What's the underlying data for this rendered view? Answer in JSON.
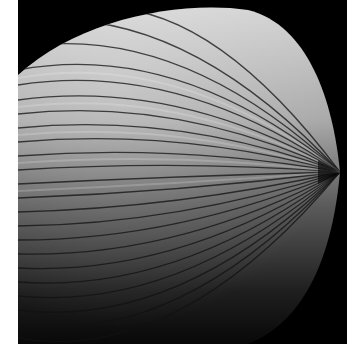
{
  "image": {
    "subject": "ribbed shell form with radiating lines converging to a point on the right",
    "alt": "Black and white photograph of a ribbed shell-like surface",
    "colors": {
      "background": "#000000",
      "border": "#ffffff",
      "highlight": "#d8d8d8",
      "shadow": "#1a1a1a"
    }
  }
}
